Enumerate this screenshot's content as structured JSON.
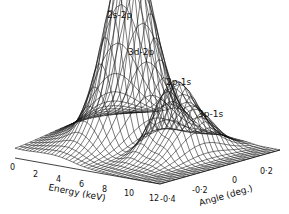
{
  "chart_data": {
    "type": "surface3d",
    "title": "",
    "x_axis": {
      "label": "Energy (keV)",
      "ticks": [
        "0",
        "2",
        "4",
        "6",
        "8",
        "10",
        "12"
      ],
      "range": [
        0,
        12
      ]
    },
    "y_axis": {
      "label": "Angle (deg.)",
      "ticks": [
        "-0.4",
        "-0.2",
        "0",
        "0.2"
      ],
      "range": [
        -0.4,
        0.3
      ]
    },
    "z_axis": {
      "label": "",
      "ticks": []
    },
    "annotations": [
      {
        "text": "2s-2p",
        "energy_keV": 3.5,
        "angle_deg": 0.0
      },
      {
        "text": "3d-2p",
        "energy_keV": 4.5,
        "angle_deg": 0.0
      },
      {
        "text": "2p-1s",
        "energy_keV": 7.5,
        "angle_deg": 0.0
      },
      {
        "text": "3p-1s",
        "energy_keV": 9.0,
        "angle_deg": 0.0
      }
    ],
    "peaks": [
      {
        "label": "2s-2p",
        "energy_keV": 3.5,
        "relative_height": 1.0
      },
      {
        "label": "3d-2p",
        "energy_keV": 4.5,
        "relative_height": 0.75
      },
      {
        "label": "2p-1s",
        "energy_keV": 7.5,
        "relative_height": 0.55
      },
      {
        "label": "3p-1s",
        "energy_keV": 9.0,
        "relative_height": 0.35
      }
    ],
    "grid": false,
    "style": "black wireframe mesh on white"
  },
  "labels": {
    "peak1": "2s-2p",
    "peak2": "3d-2p",
    "peak3": "2p-1s",
    "peak4": "3p-1s",
    "energy_axis": "Energy (keV)",
    "angle_axis": "Angle (deg.)",
    "e0": "0",
    "e2": "2",
    "e4": "4",
    "e6": "6",
    "e8": "8",
    "e10": "10",
    "e12": "12",
    "a1": "-0·4",
    "a2": "-0·2",
    "a3": "0",
    "a4": "0·2"
  }
}
